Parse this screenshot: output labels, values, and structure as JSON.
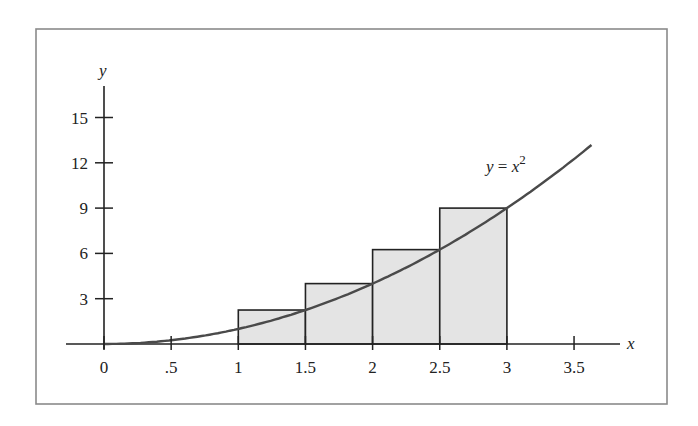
{
  "chart_data": {
    "type": "line",
    "title": "",
    "xlabel": "x",
    "ylabel": "y",
    "curve_label": "y = x²",
    "curve_label_parts": {
      "lhs": "y",
      "eq": " = ",
      "var": "x",
      "exp": "2"
    },
    "function": "y = x^2",
    "x_range_plotted": [
      0,
      3.63
    ],
    "xlim": [
      -0.28,
      3.9
    ],
    "ylim": [
      0,
      17
    ],
    "x_ticks": [
      0,
      0.5,
      1,
      1.5,
      2,
      2.5,
      3,
      3.5
    ],
    "x_tick_labels": [
      "0",
      ".5",
      "1",
      "1.5",
      "2",
      "2.5",
      "3",
      "3.5"
    ],
    "y_ticks": [
      3,
      6,
      9,
      12,
      15
    ],
    "y_tick_labels": [
      "3",
      "6",
      "9",
      "12",
      "15"
    ],
    "grid": false,
    "legend": "none",
    "rectangles": [
      {
        "x0": 1.0,
        "x1": 1.5,
        "height": 2.25
      },
      {
        "x0": 1.5,
        "x1": 2.0,
        "height": 4.0
      },
      {
        "x0": 2.0,
        "x1": 2.5,
        "height": 6.25
      },
      {
        "x0": 2.5,
        "x1": 3.0,
        "height": 9.0
      }
    ],
    "rectangle_rule": "right-endpoint",
    "colors": {
      "curve": "#4a4a4a",
      "rect_fill": "#e4e4e4",
      "rect_stroke": "#222222",
      "axis": "#222222",
      "frame": "#8a8a8a"
    }
  }
}
